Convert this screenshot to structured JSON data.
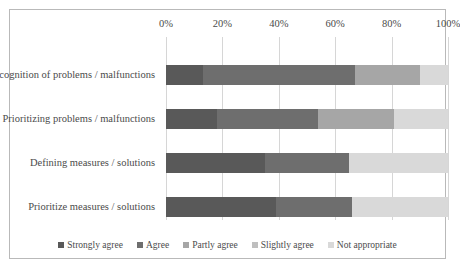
{
  "chart_data": {
    "type": "bar",
    "orientation": "horizontal",
    "stacked": true,
    "normalized": true,
    "title": "",
    "subtitle": "",
    "xlabel": "",
    "ylabel": "",
    "xlim": [
      0,
      100
    ],
    "grid": true,
    "legend_position": "bottom",
    "x_tick_labels": [
      "0%",
      "20%",
      "40%",
      "60%",
      "80%",
      "100%"
    ],
    "x_tick_values": [
      0,
      20,
      40,
      60,
      80,
      100
    ],
    "categories": [
      "Recognition of problems / malfunctions",
      "Prioritizing problems / malfunctions",
      "Defining measures / solutions",
      "Prioritize measures / solutions"
    ],
    "series": [
      {
        "name": "Strongly agree",
        "color": "#595959",
        "values": [
          13,
          18,
          35,
          39
        ]
      },
      {
        "name": "Agree",
        "color": "#6e6e6e",
        "values": [
          54,
          36,
          30,
          27
        ]
      },
      {
        "name": "Partly agree",
        "color": "#a6a6a6",
        "values": [
          23,
          27,
          0,
          0
        ]
      },
      {
        "name": "Slightly agree",
        "color": "#bfbfbf",
        "values": [
          0,
          0,
          0,
          0
        ]
      },
      {
        "name": "Not appropriate",
        "color": "#d9d9d9",
        "values": [
          10,
          19,
          35,
          34
        ]
      }
    ]
  },
  "legend": {
    "items": [
      {
        "label": "Strongly agree",
        "color": "#595959"
      },
      {
        "label": "Agree",
        "color": "#6e6e6e"
      },
      {
        "label": "Partly agree",
        "color": "#a6a6a6"
      },
      {
        "label": "Slightly agree",
        "color": "#bfbfbf"
      },
      {
        "label": "Not appropriate",
        "color": "#d9d9d9"
      }
    ]
  },
  "frame": {
    "border_color": "#b9b9b9",
    "background": "#ffffff",
    "gridline_color": "#d6d6d6"
  }
}
